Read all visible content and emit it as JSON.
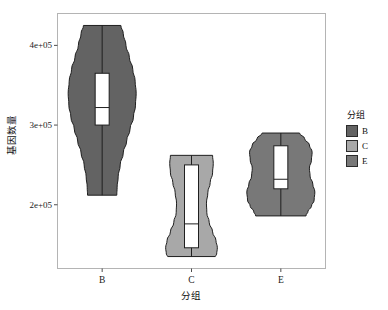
{
  "chart_data": {
    "type": "violin",
    "title": "",
    "xlabel": "分组",
    "ylabel": "基因数量",
    "categories": [
      "B",
      "C",
      "E"
    ],
    "ylim": [
      120000,
      440000
    ],
    "y_ticks": [
      200000,
      300000,
      400000
    ],
    "y_tick_labels": [
      "2e+05",
      "3e+05",
      "4e+05"
    ],
    "grid": false,
    "legend": {
      "title": "分组",
      "position": "right",
      "entries": [
        {
          "label": "B",
          "color": "#636363"
        },
        {
          "label": "C",
          "color": "#a8a8a8"
        },
        {
          "label": "E",
          "color": "#787878"
        }
      ]
    },
    "series": [
      {
        "name": "B",
        "color": "#636363",
        "violin_min": 212000,
        "violin_max": 425000,
        "box_lower": 300000,
        "box_upper": 365000,
        "median": 322000,
        "whisker_low": 212000,
        "whisker_high": 425000,
        "density_profile": [
          {
            "y": 425000,
            "w": 0.55
          },
          {
            "y": 415000,
            "w": 0.62
          },
          {
            "y": 400000,
            "w": 0.7
          },
          {
            "y": 385000,
            "w": 0.8
          },
          {
            "y": 370000,
            "w": 0.9
          },
          {
            "y": 355000,
            "w": 0.97
          },
          {
            "y": 340000,
            "w": 1.0
          },
          {
            "y": 325000,
            "w": 0.98
          },
          {
            "y": 310000,
            "w": 0.92
          },
          {
            "y": 295000,
            "w": 0.82
          },
          {
            "y": 280000,
            "w": 0.72
          },
          {
            "y": 265000,
            "w": 0.62
          },
          {
            "y": 250000,
            "w": 0.53
          },
          {
            "y": 235000,
            "w": 0.47
          },
          {
            "y": 222000,
            "w": 0.44
          },
          {
            "y": 212000,
            "w": 0.43
          }
        ]
      },
      {
        "name": "C",
        "color": "#a8a8a8",
        "violin_min": 135000,
        "violin_max": 262000,
        "box_lower": 146000,
        "box_upper": 250000,
        "median": 176000,
        "whisker_low": 135000,
        "whisker_high": 262000,
        "density_profile": [
          {
            "y": 262000,
            "w": 0.62
          },
          {
            "y": 252000,
            "w": 0.64
          },
          {
            "y": 240000,
            "w": 0.62
          },
          {
            "y": 228000,
            "w": 0.55
          },
          {
            "y": 215000,
            "w": 0.48
          },
          {
            "y": 202000,
            "w": 0.44
          },
          {
            "y": 190000,
            "w": 0.45
          },
          {
            "y": 178000,
            "w": 0.52
          },
          {
            "y": 166000,
            "w": 0.62
          },
          {
            "y": 155000,
            "w": 0.72
          },
          {
            "y": 146000,
            "w": 0.76
          },
          {
            "y": 138000,
            "w": 0.74
          },
          {
            "y": 135000,
            "w": 0.7
          }
        ]
      },
      {
        "name": "E",
        "color": "#787878",
        "violin_min": 186000,
        "violin_max": 290000,
        "box_lower": 220000,
        "box_upper": 274000,
        "median": 232000,
        "whisker_low": 186000,
        "whisker_high": 290000,
        "density_profile": [
          {
            "y": 290000,
            "w": 0.55
          },
          {
            "y": 283000,
            "w": 0.7
          },
          {
            "y": 275000,
            "w": 0.84
          },
          {
            "y": 266000,
            "w": 0.92
          },
          {
            "y": 256000,
            "w": 0.9
          },
          {
            "y": 246000,
            "w": 0.84
          },
          {
            "y": 236000,
            "w": 0.86
          },
          {
            "y": 226000,
            "w": 0.94
          },
          {
            "y": 216000,
            "w": 1.0
          },
          {
            "y": 206000,
            "w": 0.98
          },
          {
            "y": 198000,
            "w": 0.9
          },
          {
            "y": 192000,
            "w": 0.8
          },
          {
            "y": 186000,
            "w": 0.74
          }
        ]
      }
    ]
  },
  "panel": {
    "border_color": "#b4b4b4",
    "background": "#ffffff",
    "outline_color": "#1f1f1f"
  }
}
